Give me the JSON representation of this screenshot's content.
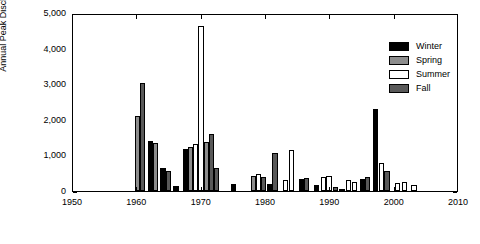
{
  "chart_data": {
    "type": "bar",
    "title": "",
    "xlabel": "",
    "ylabel": "Annual Peak Discharge (ft³/s)",
    "xlim": [
      1950,
      2010
    ],
    "ylim": [
      0,
      5000
    ],
    "xticks": [
      "1950",
      "1960",
      "1970",
      "1980",
      "1990",
      "2000",
      "2010"
    ],
    "yticks": [
      "0",
      "1,000",
      "2,000",
      "3,000",
      "4,000",
      "5,000"
    ],
    "grid": false,
    "legend_position": "top-right",
    "legend": [
      {
        "name": "Winter",
        "color": "#000000"
      },
      {
        "name": "Spring",
        "color": "#8c8c8c"
      },
      {
        "name": "Summer",
        "color": "#ffffff"
      },
      {
        "name": "Fall",
        "color": "#595959"
      }
    ],
    "bars": [
      {
        "year": 1960.0,
        "value": 2120,
        "season": "Spring"
      },
      {
        "year": 1960.8,
        "value": 3030,
        "season": "Fall"
      },
      {
        "year": 1962.0,
        "value": 1400,
        "season": "Winter"
      },
      {
        "year": 1962.8,
        "value": 1340,
        "season": "Spring"
      },
      {
        "year": 1964.0,
        "value": 640,
        "season": "Winter"
      },
      {
        "year": 1964.8,
        "value": 560,
        "season": "Fall"
      },
      {
        "year": 1966.0,
        "value": 140,
        "season": "Winter"
      },
      {
        "year": 1967.5,
        "value": 1180,
        "season": "Winter"
      },
      {
        "year": 1968.3,
        "value": 1240,
        "season": "Spring"
      },
      {
        "year": 1969.1,
        "value": 1310,
        "season": "Summer"
      },
      {
        "year": 1969.9,
        "value": 4630,
        "season": "Summer"
      },
      {
        "year": 1970.7,
        "value": 1380,
        "season": "Spring"
      },
      {
        "year": 1971.5,
        "value": 1600,
        "season": "Fall"
      },
      {
        "year": 1972.3,
        "value": 660,
        "season": "Fall"
      },
      {
        "year": 1975.0,
        "value": 200,
        "season": "Winter"
      },
      {
        "year": 1978.0,
        "value": 420,
        "season": "Spring"
      },
      {
        "year": 1978.8,
        "value": 470,
        "season": "Summer"
      },
      {
        "year": 1979.6,
        "value": 390,
        "season": "Fall"
      },
      {
        "year": 1980.6,
        "value": 200,
        "season": "Winter"
      },
      {
        "year": 1981.4,
        "value": 1080,
        "season": "Fall"
      },
      {
        "year": 1983.0,
        "value": 300,
        "season": "Summer"
      },
      {
        "year": 1984.0,
        "value": 1140,
        "season": "Summer"
      },
      {
        "year": 1985.5,
        "value": 330,
        "season": "Winter"
      },
      {
        "year": 1986.3,
        "value": 360,
        "season": "Fall"
      },
      {
        "year": 1987.8,
        "value": 180,
        "season": "Winter"
      },
      {
        "year": 1989.0,
        "value": 380,
        "season": "Summer"
      },
      {
        "year": 1989.8,
        "value": 430,
        "season": "Summer"
      },
      {
        "year": 1990.8,
        "value": 120,
        "season": "Fall"
      },
      {
        "year": 1991.8,
        "value": 60,
        "season": "Summer"
      },
      {
        "year": 1992.8,
        "value": 300,
        "season": "Summer"
      },
      {
        "year": 1993.8,
        "value": 250,
        "season": "Summer"
      },
      {
        "year": 1995.0,
        "value": 330,
        "season": "Winter"
      },
      {
        "year": 1995.8,
        "value": 390,
        "season": "Fall"
      },
      {
        "year": 1997.0,
        "value": 2310,
        "season": "Winter"
      },
      {
        "year": 1998.0,
        "value": 790,
        "season": "Summer"
      },
      {
        "year": 1998.8,
        "value": 560,
        "season": "Fall"
      },
      {
        "year": 2000.5,
        "value": 230,
        "season": "Summer"
      },
      {
        "year": 2001.5,
        "value": 250,
        "season": "Summer"
      },
      {
        "year": 2003.0,
        "value": 180,
        "season": "Summer"
      }
    ]
  }
}
